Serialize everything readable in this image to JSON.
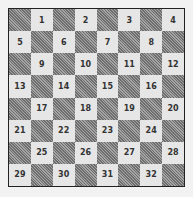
{
  "board": {
    "rows": 8,
    "cols": 8,
    "top_left_color": "dark",
    "numbering": "playable light squares numbered 1-32 left-to-right, top-to-bottom",
    "squares": [
      "1",
      "2",
      "3",
      "4",
      "5",
      "6",
      "7",
      "8",
      "9",
      "10",
      "11",
      "12",
      "13",
      "14",
      "15",
      "16",
      "17",
      "18",
      "19",
      "20",
      "21",
      "22",
      "23",
      "24",
      "25",
      "26",
      "27",
      "28",
      "29",
      "30",
      "31",
      "32"
    ],
    "colors": {
      "dark": "#888888",
      "light": "#e6e6e6",
      "border": "#222222",
      "background": "#f2f2f2"
    }
  }
}
